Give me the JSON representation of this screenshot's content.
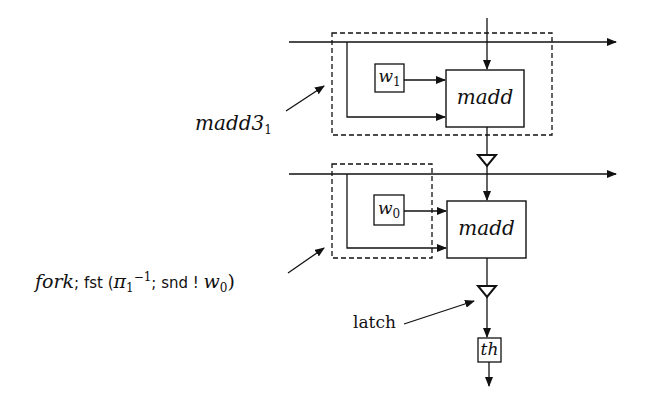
{
  "diagram": {
    "type": "circuit-block-diagram",
    "stages": [
      {
        "id": "stage1",
        "annotation": {
          "main": "madd3",
          "subscript": "1"
        },
        "weight_box": {
          "main": "w",
          "subscript": "1"
        },
        "block": {
          "label": "madd"
        }
      },
      {
        "id": "stage0",
        "annotation": {
          "part1": "fork",
          "part2": "; fst (",
          "pi": "π",
          "pi_sub": "1",
          "pi_sup": "−1",
          "part3": "; snd ! ",
          "w": "w",
          "w_sub": "0",
          "close": ")"
        },
        "weight_box": {
          "main": "w",
          "subscript": "0"
        },
        "block": {
          "label": "madd"
        }
      }
    ],
    "latch_label": "latch",
    "output_block": {
      "label": "th"
    }
  }
}
